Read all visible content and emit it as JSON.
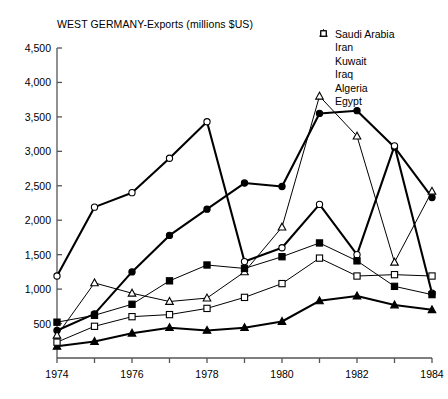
{
  "chart_data": {
    "type": "line",
    "title": "WEST GERMANY-Exports (millions $US)",
    "xlabel": "",
    "ylabel": "",
    "x": [
      1974,
      1975,
      1976,
      1977,
      1978,
      1979,
      1980,
      1981,
      1982,
      1983,
      1984
    ],
    "xlim": [
      1974,
      1984
    ],
    "ylim": [
      0,
      4500
    ],
    "yticks": [
      500,
      1000,
      1500,
      2000,
      2500,
      3000,
      3500,
      4000,
      4500
    ],
    "ytick_labels": [
      "500",
      "1,000",
      "1,500",
      "2,000",
      "2,500",
      "3,000",
      "3,500",
      "4,000",
      "4,500"
    ],
    "xticks": [
      1974,
      1975,
      1976,
      1977,
      1978,
      1979,
      1980,
      1981,
      1982,
      1983,
      1984
    ],
    "xtick_labels_shown": [
      "1974",
      "1976",
      "1978",
      "1980",
      "1982",
      "1984"
    ],
    "grid": false,
    "legend_position": "top-right",
    "series": [
      {
        "name": "Saudi Arabia",
        "marker": "filled-circle",
        "values": [
          400,
          640,
          1250,
          1780,
          2160,
          2540,
          2490,
          3550,
          3590,
          3060,
          2330
        ]
      },
      {
        "name": "Iran",
        "marker": "open-circle",
        "values": [
          1190,
          2190,
          2400,
          2900,
          3430,
          1400,
          1600,
          2230,
          1500,
          3080,
          940
        ]
      },
      {
        "name": "Kuwait",
        "marker": "filled-triangle",
        "values": [
          170,
          240,
          360,
          440,
          400,
          440,
          530,
          830,
          900,
          770,
          700
        ]
      },
      {
        "name": "Iraq",
        "marker": "open-triangle",
        "values": [
          330,
          1090,
          940,
          820,
          870,
          1250,
          1900,
          3800,
          3220,
          1390,
          2420
        ]
      },
      {
        "name": "Algeria",
        "marker": "filled-square",
        "values": [
          520,
          620,
          780,
          1120,
          1350,
          1300,
          1470,
          1670,
          1410,
          1040,
          920
        ]
      },
      {
        "name": "Egypt",
        "marker": "open-square",
        "values": [
          230,
          460,
          600,
          630,
          720,
          880,
          1080,
          1450,
          1190,
          1210,
          1190
        ]
      }
    ]
  },
  "legend": {
    "items": [
      {
        "label": "Saudi Arabia",
        "marker": "filled-circle"
      },
      {
        "label": "Iran",
        "marker": "open-circle"
      },
      {
        "label": "Kuwait",
        "marker": "filled-triangle"
      },
      {
        "label": "Iraq",
        "marker": "open-triangle"
      },
      {
        "label": "Algeria",
        "marker": "filled-square"
      },
      {
        "label": "Egypt",
        "marker": "open-square"
      }
    ]
  },
  "colors": {
    "ink": "#000000",
    "axis": "#555555",
    "background": "#ffffff"
  }
}
